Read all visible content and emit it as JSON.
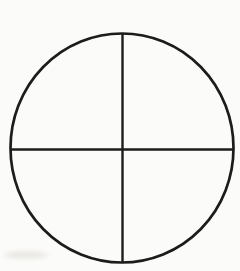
{
  "canvas": {
    "width": 240,
    "height": 271,
    "background": "#fbfbf9"
  },
  "figure": {
    "ink_color": "#1c1c1c",
    "circle": {
      "cx": 122,
      "cy": 148,
      "rx": 111.5,
      "ry": 114.5,
      "stroke_width": 2.7
    },
    "vertical_line": {
      "x": 122.5,
      "y1": 34,
      "y2": 262,
      "stroke_width": 2.4
    },
    "horizontal_line": {
      "y": 149.5,
      "x1": 10.5,
      "x2": 233,
      "stroke_width": 2.4
    },
    "scan_smudge": {
      "x": 4,
      "y": 251,
      "width": 44,
      "height": 8,
      "color": "#e6e4e0",
      "opacity": 0.8
    }
  }
}
